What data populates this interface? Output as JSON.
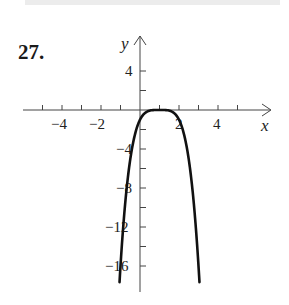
{
  "problem": {
    "number": "27."
  },
  "chart_data": {
    "type": "line",
    "title": "",
    "xlabel": "x",
    "ylabel": "y",
    "function": "y = -(x - 1)^4",
    "x_ticks": [
      -5,
      -4,
      -3,
      -2,
      -1,
      1,
      2,
      3,
      4,
      5
    ],
    "x_tick_labels": [
      "-4",
      "-2",
      "2",
      "4"
    ],
    "y_ticks": [
      4,
      2,
      -2,
      -4,
      -6,
      -8,
      -10,
      -12,
      -14,
      -16
    ],
    "y_tick_labels": [
      "4",
      "-4",
      "-8",
      "-12",
      "-16"
    ],
    "xlim": [
      -6,
      6.7
    ],
    "ylim": [
      -18.6,
      7.6
    ],
    "grid": false,
    "series": [
      {
        "name": "curve",
        "x": [
          -1.05,
          -0.5,
          0,
          0.5,
          1,
          1.5,
          2,
          2.5,
          3.05
        ],
        "values": [
          -17.6,
          -5.06,
          -1,
          -0.06,
          0,
          -0.06,
          -1,
          -5.06,
          -17.6
        ]
      }
    ]
  },
  "labels": {
    "x_axis": "x",
    "y_axis": "y",
    "x_neg4": "−4",
    "x_neg2": "−2",
    "x_2": "2",
    "x_4": "4",
    "y_4": "4",
    "y_neg4": "−4",
    "y_neg8": "−8",
    "y_neg12": "−12",
    "y_neg16": "−16"
  }
}
